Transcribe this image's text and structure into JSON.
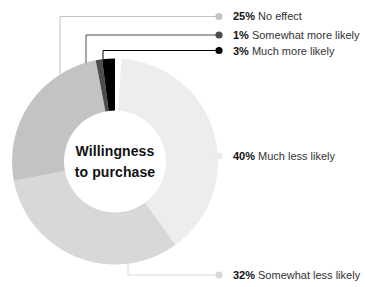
{
  "chart_data": {
    "type": "pie",
    "variant": "donut",
    "title": "Willingness to purchase",
    "center_label_lines": [
      "Willingness",
      "to purchase"
    ],
    "direction": "clockwise",
    "start_at_top": true,
    "unit": "%",
    "segments": [
      {
        "id": "much-less",
        "label": "Much less likely",
        "value": 40,
        "pct_text": "40%",
        "color": "#ededed"
      },
      {
        "id": "somewhat-less",
        "label": "Somewhat less likely",
        "value": 32,
        "pct_text": "32%",
        "color": "#d8d8d8"
      },
      {
        "id": "no-effect",
        "label": "No effect",
        "value": 25,
        "pct_text": "25%",
        "color": "#c3c3c3"
      },
      {
        "id": "somewhat-more",
        "label": "Somewhat more likely",
        "value": 1,
        "pct_text": "1%",
        "color": "#4d4d4d"
      },
      {
        "id": "much-more",
        "label": "Much more likely",
        "value": 3,
        "pct_text": "3%",
        "color": "#000000"
      }
    ],
    "callouts": [
      {
        "segment": "no-effect",
        "pct_text": "25%",
        "label": "No effect"
      },
      {
        "segment": "somewhat-more",
        "pct_text": "1%",
        "label": "Somewhat more likely"
      },
      {
        "segment": "much-more",
        "pct_text": "3%",
        "label": "Much more likely"
      },
      {
        "segment": "much-less",
        "pct_text": "40%",
        "label": "Much less likely"
      },
      {
        "segment": "somewhat-less",
        "pct_text": "32%",
        "label": "Somewhat less likely"
      }
    ],
    "colors": {
      "background": "#ffffff",
      "label_text": "#333333",
      "pct_text": "#111111",
      "center_text": "#111111"
    }
  }
}
